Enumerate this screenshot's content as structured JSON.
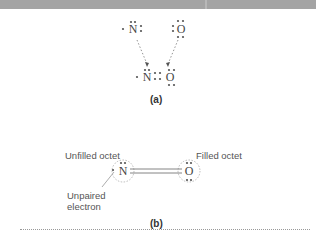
{
  "panel_a": {
    "label": "(a)",
    "atom_n": "N",
    "atom_o": "O",
    "product_n": "N",
    "product_o": "O"
  },
  "panel_b": {
    "label": "(b)",
    "atom_n": "N",
    "atom_o": "O",
    "label_unfilled": "Unfilled octet",
    "label_filled": "Filled octet",
    "label_unpaired_line1": "Unpaired",
    "label_unpaired_line2": "electron"
  },
  "colors": {
    "dots": "#555555",
    "arrows": "#888888",
    "text": "#444444"
  }
}
